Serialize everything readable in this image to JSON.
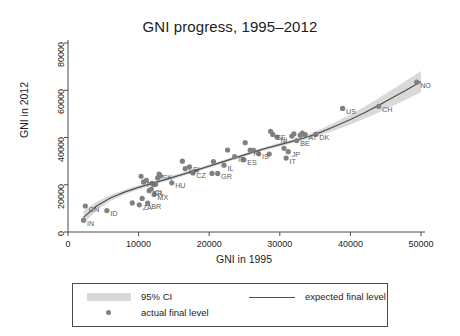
{
  "chart_data": {
    "type": "scatter",
    "title": "GNI progress, 1995–2012",
    "xlabel": "GNI in 1995",
    "ylabel": "GNI in 2012",
    "xlim": [
      0,
      50000
    ],
    "ylim": [
      0,
      80000
    ],
    "xticks": [
      0,
      10000,
      20000,
      30000,
      40000,
      50000
    ],
    "yticks": [
      0,
      20000,
      40000,
      60000,
      80000
    ],
    "xtick_labels": [
      "0",
      "10000",
      "20000",
      "30000",
      "40000",
      "50000"
    ],
    "ytick_labels": [
      "0",
      "20000",
      "40000",
      "60000",
      "80000"
    ],
    "grid": false,
    "legend_position": "below-axes",
    "series": [
      {
        "name": "actual final level",
        "type": "scatter",
        "color": "#808080",
        "points": [
          {
            "label": "IN",
            "x": 2200,
            "y": 5000
          },
          {
            "label": "CN",
            "x": 2450,
            "y": 11000
          },
          {
            "label": "ID",
            "x": 5500,
            "y": 9100
          },
          {
            "label": "",
            "x": 9100,
            "y": 12300
          },
          {
            "label": "ZA",
            "x": 10100,
            "y": 11500
          },
          {
            "label": "",
            "x": 10350,
            "y": 23600
          },
          {
            "label": "",
            "x": 10500,
            "y": 14200
          },
          {
            "label": "BR",
            "x": 11300,
            "y": 12200
          },
          {
            "label": "PE",
            "x": 10700,
            "y": 21200
          },
          {
            "label": "",
            "x": 11100,
            "y": 21900
          },
          {
            "label": "TR",
            "x": 11500,
            "y": 17500
          },
          {
            "label": "CL",
            "x": 11800,
            "y": 18200
          },
          {
            "label": "MX",
            "x": 12200,
            "y": 15900
          },
          {
            "label": "",
            "x": 11900,
            "y": 20600
          },
          {
            "label": "",
            "x": 12400,
            "y": 20200
          },
          {
            "label": "",
            "x": 12700,
            "y": 22900
          },
          {
            "label": "SK",
            "x": 12900,
            "y": 24500
          },
          {
            "label": "",
            "x": 13100,
            "y": 23700
          },
          {
            "label": "HU",
            "x": 14700,
            "y": 20800
          },
          {
            "label": "",
            "x": 16200,
            "y": 30000
          },
          {
            "label": "KR",
            "x": 16600,
            "y": 26800
          },
          {
            "label": "SI",
            "x": 17200,
            "y": 27600
          },
          {
            "label": "CZ",
            "x": 17700,
            "y": 25000
          },
          {
            "label": "",
            "x": 20400,
            "y": 24800
          },
          {
            "label": "GR",
            "x": 21200,
            "y": 24800
          },
          {
            "label": "",
            "x": 20600,
            "y": 29800
          },
          {
            "label": "IL",
            "x": 22100,
            "y": 28300
          },
          {
            "label": "",
            "x": 22600,
            "y": 34700
          },
          {
            "label": "IE",
            "x": 23600,
            "y": 31900
          },
          {
            "label": "ES",
            "x": 24900,
            "y": 30600
          },
          {
            "label": "",
            "x": 25100,
            "y": 37800
          },
          {
            "label": "FI",
            "x": 25800,
            "y": 34700
          },
          {
            "label": "IS",
            "x": 27000,
            "y": 33100
          },
          {
            "label": "",
            "x": 26300,
            "y": 34600
          },
          {
            "label": "",
            "x": 28700,
            "y": 42600
          },
          {
            "label": "SE",
            "x": 29000,
            "y": 41300
          },
          {
            "label": "NL",
            "x": 29600,
            "y": 40200
          },
          {
            "label": "",
            "x": 28500,
            "y": 33000
          },
          {
            "label": "IT",
            "x": 30900,
            "y": 31300
          },
          {
            "label": "JP",
            "x": 31200,
            "y": 34000
          },
          {
            "label": "",
            "x": 30600,
            "y": 35400
          },
          {
            "label": "",
            "x": 31700,
            "y": 40600
          },
          {
            "label": "",
            "x": 32000,
            "y": 41500
          },
          {
            "label": "BE",
            "x": 32400,
            "y": 38700
          },
          {
            "label": "",
            "x": 32900,
            "y": 41000
          },
          {
            "label": "",
            "x": 33200,
            "y": 41900
          },
          {
            "label": "AT",
            "x": 33600,
            "y": 41200
          },
          {
            "label": "DK",
            "x": 35100,
            "y": 41300
          },
          {
            "label": "US",
            "x": 38900,
            "y": 52300
          },
          {
            "label": "CH",
            "x": 44000,
            "y": 53200
          },
          {
            "label": "NO",
            "x": 49400,
            "y": 63400
          }
        ]
      },
      {
        "name": "expected final level",
        "type": "line",
        "color": "#4f4f4f",
        "x": [
          2200,
          4000,
          6000,
          8000,
          10000,
          12000,
          14000,
          16000,
          18000,
          20000,
          22000,
          24000,
          26000,
          28000,
          30000,
          32000,
          34000,
          36000,
          38000,
          40000,
          42000,
          44000,
          46000,
          48000,
          50000
        ],
        "y": [
          6200,
          10900,
          14400,
          16900,
          18900,
          20700,
          22400,
          24200,
          26000,
          27900,
          29800,
          31700,
          33600,
          35400,
          37000,
          38600,
          40300,
          42500,
          45000,
          47600,
          50500,
          53600,
          56900,
          60200,
          63700
        ]
      },
      {
        "name": "95% CI",
        "type": "band",
        "color": "#d9d9d9",
        "x": [
          2200,
          4000,
          6000,
          8000,
          10000,
          12000,
          14000,
          16000,
          18000,
          20000,
          22000,
          24000,
          26000,
          28000,
          30000,
          32000,
          34000,
          36000,
          38000,
          40000,
          42000,
          44000,
          46000,
          48000,
          50000
        ],
        "lower": [
          3500,
          9100,
          13100,
          15900,
          18000,
          19900,
          21600,
          23400,
          25300,
          27200,
          29100,
          31000,
          32900,
          34700,
          36200,
          37800,
          39300,
          41200,
          43300,
          45500,
          48000,
          50600,
          53400,
          56200,
          59200
        ],
        "upper": [
          8900,
          12700,
          15700,
          17900,
          19800,
          21500,
          23200,
          25000,
          26700,
          28600,
          30500,
          32400,
          34300,
          36100,
          37800,
          39400,
          41300,
          43800,
          46700,
          49700,
          53000,
          56600,
          60400,
          64200,
          68200
        ]
      }
    ]
  },
  "legend": {
    "ci_label": "95% CI",
    "expected_label": "expected final level",
    "actual_label": "actual final level"
  }
}
